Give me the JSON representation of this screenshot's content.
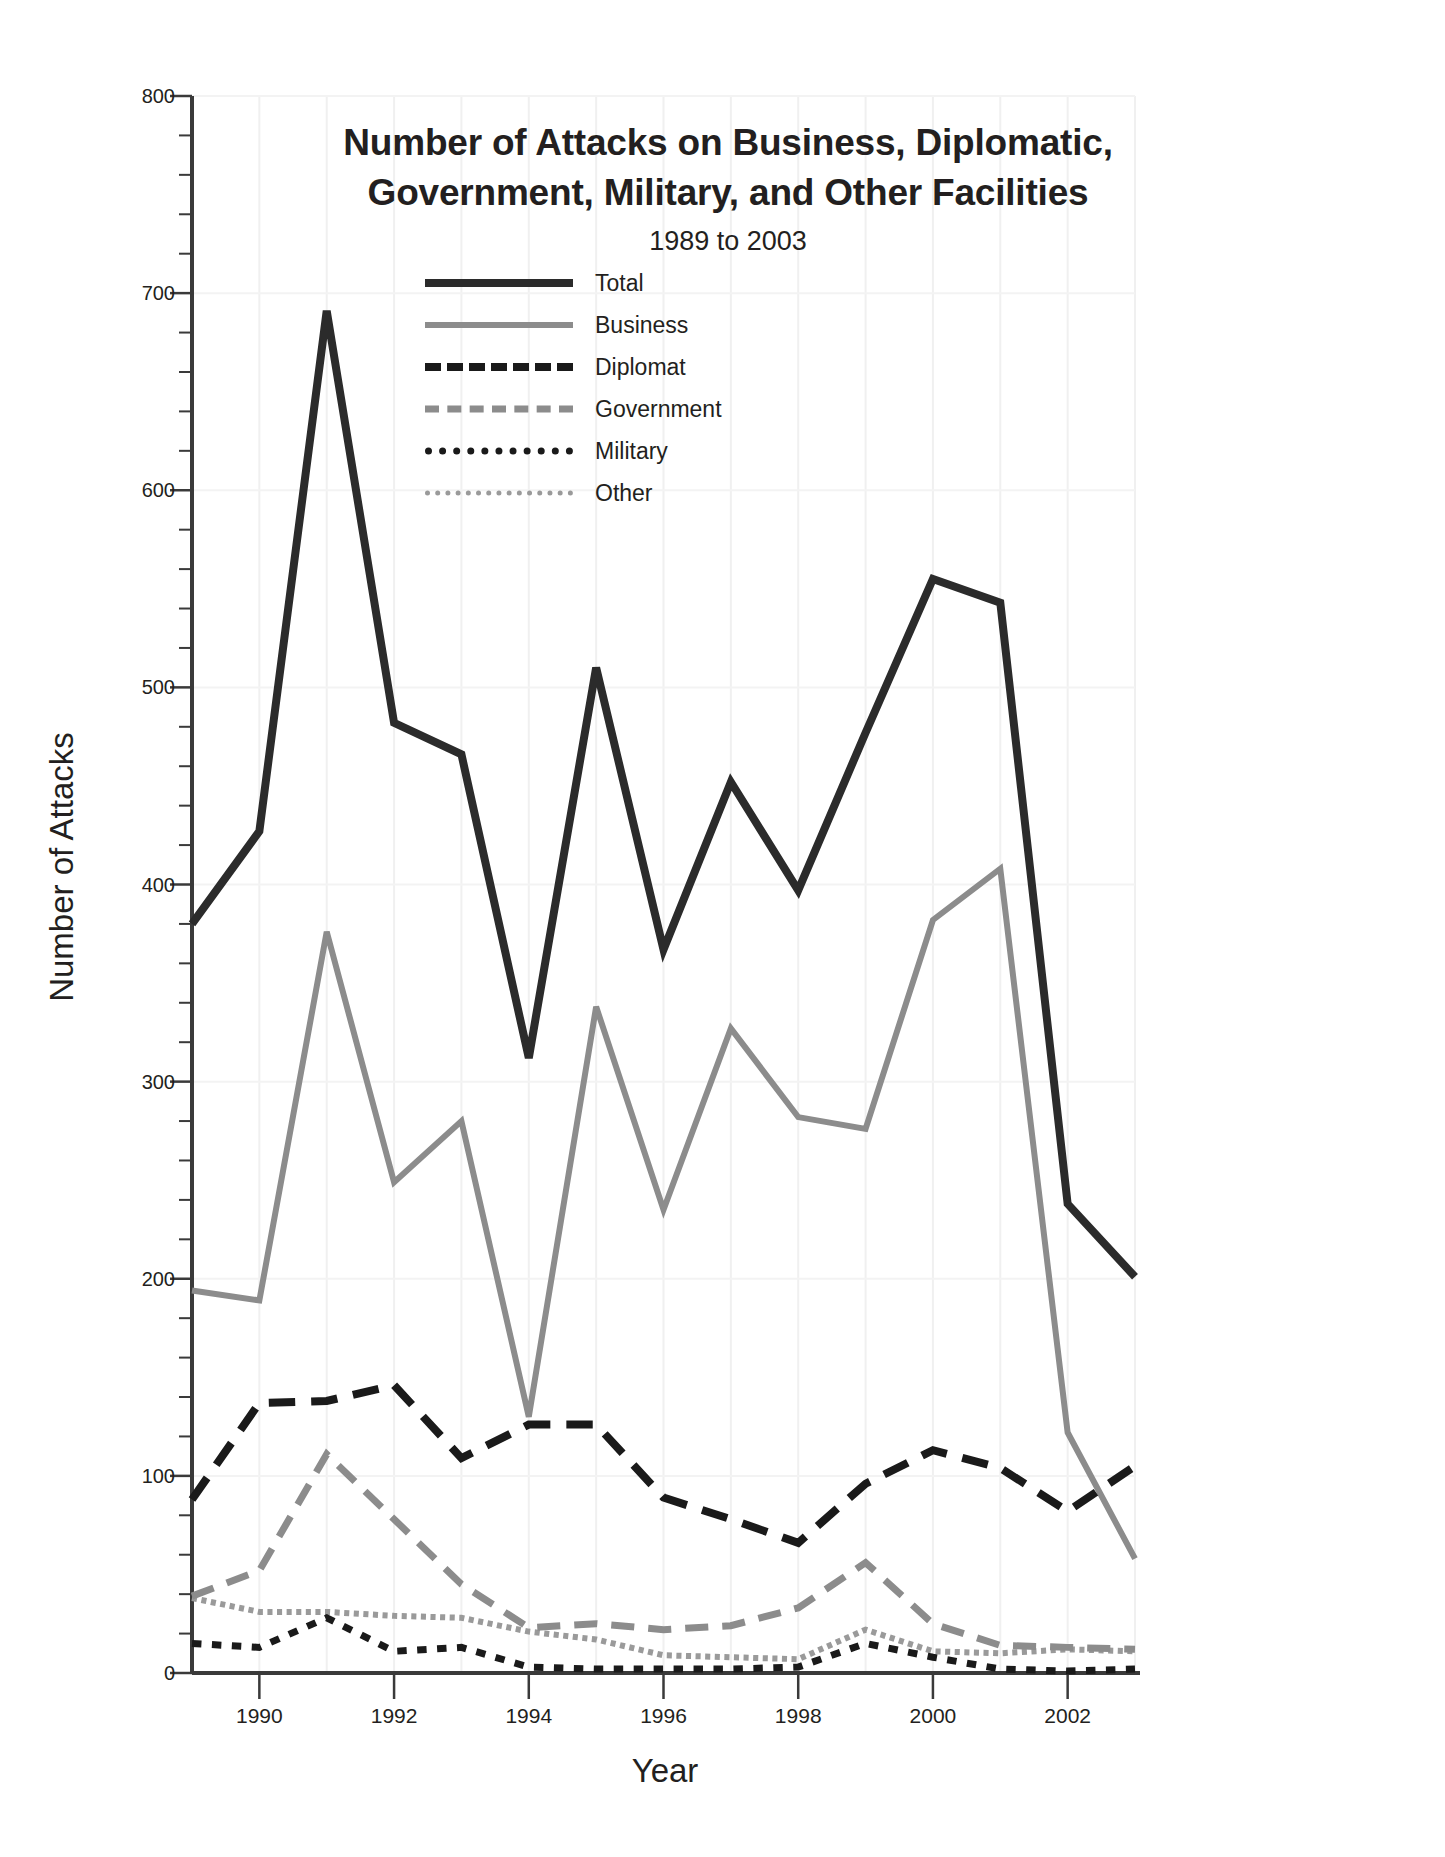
{
  "chart_data": {
    "type": "line",
    "title": "Number of Attacks on Business, Diplomatic, Government, Military, and Other Facilities",
    "title_line1": "Number of Attacks on Business, Diplomatic,",
    "title_line2": "Government, Military, and Other Facilities",
    "subtitle": "1989 to 2003",
    "xlabel": "Year",
    "ylabel": "Number of Attacks",
    "xlim": [
      1989,
      2003
    ],
    "ylim": [
      0,
      800
    ],
    "grid": true,
    "legend_position": "upper-center",
    "y_major_step": 100,
    "y_minor_step": 20,
    "x_tick_labels": [
      "1990",
      "1992",
      "1994",
      "1996",
      "1998",
      "2000",
      "2002"
    ],
    "x_tick_values": [
      1990,
      1992,
      1994,
      1996,
      1998,
      2000,
      2002
    ],
    "y_tick_labels": [
      "0",
      "100",
      "200",
      "300",
      "400",
      "500",
      "600",
      "700",
      "800"
    ],
    "y_tick_values": [
      0,
      100,
      200,
      300,
      400,
      500,
      600,
      700,
      800
    ],
    "x": [
      1989,
      1990,
      1991,
      1992,
      1993,
      1994,
      1995,
      1996,
      1997,
      1998,
      1999,
      2000,
      2001,
      2002,
      2003
    ],
    "series": [
      {
        "name": "Total",
        "color": "#2b2b2b",
        "style": "solid",
        "width": 8,
        "values": [
          380,
          427,
          691,
          482,
          466,
          312,
          510,
          367,
          452,
          397,
          477,
          555,
          543,
          238,
          201
        ]
      },
      {
        "name": "Business",
        "color": "#8c8c8c",
        "style": "solid",
        "width": 6,
        "values": [
          194,
          189,
          376,
          249,
          280,
          130,
          338,
          235,
          327,
          282,
          276,
          382,
          408,
          122,
          58
        ]
      },
      {
        "name": "Diplomat",
        "color": "#1a1a1a",
        "style": "dashed",
        "width": 8,
        "values": [
          88,
          137,
          138,
          146,
          109,
          126,
          126,
          89,
          78,
          66,
          96,
          113,
          104,
          82,
          105
        ]
      },
      {
        "name": "Government",
        "color": "#8c8c8c",
        "style": "dashed",
        "width": 7,
        "values": [
          39,
          52,
          111,
          78,
          45,
          23,
          25,
          22,
          24,
          33,
          56,
          25,
          14,
          13,
          12
        ]
      },
      {
        "name": "Military",
        "color": "#1a1a1a",
        "style": "dotted",
        "width": 7,
        "values": [
          15,
          13,
          28,
          11,
          13,
          3,
          2,
          2,
          2,
          3,
          15,
          8,
          2,
          1,
          2
        ]
      },
      {
        "name": "Other",
        "color": "#9a9a9a",
        "style": "fine-dotted",
        "width": 6,
        "values": [
          38,
          31,
          31,
          29,
          28,
          21,
          17,
          9,
          8,
          7,
          22,
          11,
          10,
          12,
          11
        ]
      }
    ]
  },
  "legend": {
    "items": [
      {
        "label": "Total"
      },
      {
        "label": "Business"
      },
      {
        "label": "Diplomat"
      },
      {
        "label": "Government"
      },
      {
        "label": "Military"
      },
      {
        "label": "Other"
      }
    ]
  }
}
